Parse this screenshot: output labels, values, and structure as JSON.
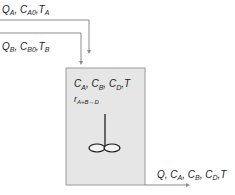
{
  "diagram": {
    "type": "CSTR reactor flow diagram",
    "inlet_a": {
      "label": "Q_A, C_A0, T_A",
      "parts": [
        "Q",
        "A",
        ", C",
        "A0",
        ",T",
        "A"
      ]
    },
    "inlet_b": {
      "label": "Q_B, C_B0, T_B",
      "parts": [
        "Q",
        "B",
        ", C",
        "B0",
        ",T",
        "B"
      ]
    },
    "reactor": {
      "contents_label": "C_A, C_B, C_D, T",
      "contents_parts": [
        "C",
        "A",
        ", C",
        "B",
        ", C",
        "D",
        ",T"
      ],
      "rate_label": "r_A+B→D",
      "rate_parts": [
        "r",
        "A+B→D"
      ]
    },
    "outlet": {
      "label": "Q, C_A, C_B, C_D, T",
      "parts": [
        "Q, C",
        "A",
        ", C",
        "B",
        ", C",
        "D",
        ",T"
      ]
    },
    "colors": {
      "line": "#8a8a8a",
      "reactor_fill": "#e6e6e6",
      "reactor_border": "#9a9a9a",
      "text": "#222222"
    }
  }
}
